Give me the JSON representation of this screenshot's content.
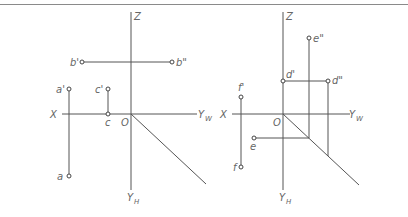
{
  "diagram": {
    "type": "orthographic-projection",
    "left": {
      "axes": {
        "z": "Z",
        "x": "X",
        "yw": "Y",
        "yw_sub": "W",
        "yh": "Y",
        "yh_sub": "H",
        "origin": "O"
      },
      "points": [
        {
          "name": "b'",
          "label": "b'"
        },
        {
          "name": "b''",
          "label": "b\""
        },
        {
          "name": "a'",
          "label": "a'"
        },
        {
          "name": "a",
          "label": "a"
        },
        {
          "name": "c'",
          "label": "c'"
        },
        {
          "name": "c",
          "label": "c"
        }
      ]
    },
    "right": {
      "axes": {
        "z": "Z",
        "x": "X",
        "yw": "Y",
        "yw_sub": "W",
        "yh": "Y",
        "yh_sub": "H",
        "origin": "O"
      },
      "points": [
        {
          "name": "e''",
          "label": "e\""
        },
        {
          "name": "d'",
          "label": "d'"
        },
        {
          "name": "d''",
          "label": "d\""
        },
        {
          "name": "f'",
          "label": "f'"
        },
        {
          "name": "e",
          "label": "e"
        },
        {
          "name": "f",
          "label": "f"
        }
      ]
    }
  }
}
